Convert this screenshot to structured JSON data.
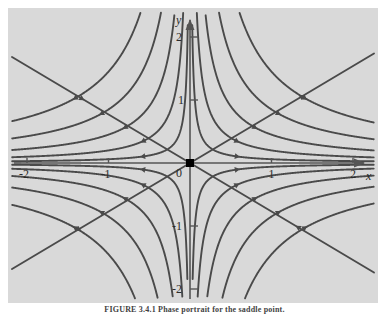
{
  "figure": {
    "kind": "phase-portrait",
    "caption": "FIGURE 3.4.1  Phase portrait for the saddle point.",
    "panel": {
      "background_color": "#d9d9d9",
      "page_background_color": "#ffffff"
    }
  },
  "axes": {
    "x_axis_label": "x",
    "y_axis_label": "y",
    "origin_label": "0",
    "x_ticks": [
      {
        "value": -2,
        "label": "-2"
      },
      {
        "value": -1,
        "label": "-1"
      },
      {
        "value": 1,
        "label": "1"
      },
      {
        "value": 2,
        "label": "2"
      }
    ],
    "y_ticks": [
      {
        "value": 2,
        "label": "2"
      },
      {
        "value": 1,
        "label": "1"
      },
      {
        "value": -1,
        "label": "-1"
      },
      {
        "value": -2,
        "label": "-2"
      }
    ],
    "axis_color": "#555555",
    "tick_color": "#555555"
  },
  "chart_data": {
    "type": "line",
    "title": "",
    "xlabel": "x",
    "ylabel": "y",
    "xlim": [
      -2.25,
      2.3
    ],
    "ylim": [
      -2.35,
      2.3
    ],
    "grid": false,
    "legend": null,
    "curve_color": "#4a4a4a",
    "equilibrium": {
      "x": 0,
      "y": 0,
      "marker": "filled-square",
      "color": "#000000"
    },
    "family": "xy = c  (saddle / hyperbolic trajectories)",
    "separatrix_slopes": [
      0.77,
      -0.77
    ],
    "series": [
      {
        "name": "c = 0.06",
        "c": 0.06,
        "quadrant": "I"
      },
      {
        "name": "c = 0.20",
        "c": 0.2,
        "quadrant": "I"
      },
      {
        "name": "c = 0.45",
        "c": 0.45,
        "quadrant": "I"
      },
      {
        "name": "c = 0.85",
        "c": 0.85,
        "quadrant": "I"
      },
      {
        "name": "c = 1.45",
        "c": 1.45,
        "quadrant": "I"
      },
      {
        "name": "c = -0.06",
        "c": -0.06,
        "quadrant": "II"
      },
      {
        "name": "c = -0.20",
        "c": -0.2,
        "quadrant": "II"
      },
      {
        "name": "c = -0.45",
        "c": -0.45,
        "quadrant": "II"
      },
      {
        "name": "c = -0.85",
        "c": -0.85,
        "quadrant": "II"
      },
      {
        "name": "c = -1.45",
        "c": -1.45,
        "quadrant": "II"
      },
      {
        "name": "c = 0.06 q3",
        "c": 0.06,
        "quadrant": "III"
      },
      {
        "name": "c = 0.20 q3",
        "c": 0.2,
        "quadrant": "III"
      },
      {
        "name": "c = 0.45 q3",
        "c": 0.45,
        "quadrant": "III"
      },
      {
        "name": "c = 0.85 q3",
        "c": 0.85,
        "quadrant": "III"
      },
      {
        "name": "c = 1.45 q3",
        "c": 1.45,
        "quadrant": "III"
      },
      {
        "name": "c = -0.06 q4",
        "c": -0.06,
        "quadrant": "IV"
      },
      {
        "name": "c = -0.20 q4",
        "c": -0.2,
        "quadrant": "IV"
      },
      {
        "name": "c = -0.45 q4",
        "c": -0.45,
        "quadrant": "IV"
      },
      {
        "name": "c = -0.85 q4",
        "c": -0.85,
        "quadrant": "IV"
      },
      {
        "name": "c = -1.45 q4",
        "c": -1.45,
        "quadrant": "IV"
      }
    ],
    "flow_arrows": "inward along the stable (steeper-descending) directions, outward along the unstable directions"
  }
}
